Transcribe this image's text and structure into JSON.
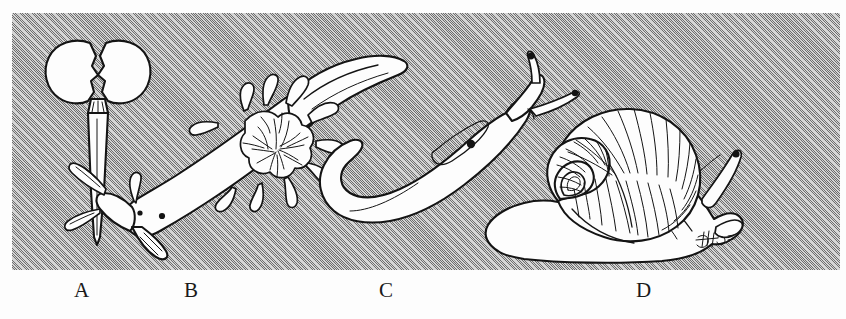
{
  "figure": {
    "caption_labels": [
      {
        "key": "a",
        "text": "A",
        "subject": "sea-butterfly-pteropod",
        "x": 74
      },
      {
        "key": "b",
        "text": "B",
        "subject": "nudibranch-sea-slug",
        "x": 184
      },
      {
        "key": "c",
        "text": "C",
        "subject": "terrestrial-slug",
        "x": 379
      },
      {
        "key": "d",
        "text": "D",
        "subject": "land-snail",
        "x": 636
      }
    ],
    "panel": {
      "x": 12,
      "y": 13,
      "width": 828,
      "height": 257,
      "background_color": "#a9a9a9",
      "texture": "diagonal-hatch-45deg",
      "ink_color": "#1a1a1a",
      "body_fill": "#fdfdfd"
    },
    "specimens": [
      {
        "id": "a",
        "name": "sea-butterfly",
        "description": "winged pteropod with two lateral parapodial lobes and a long tapering body",
        "orientation": "vertical"
      },
      {
        "id": "b",
        "name": "nudibranch",
        "description": "dorid sea slug with branched gill rosette, rhinophores, marginal papillae and a raised pointed tail",
        "orientation": "diagonal"
      },
      {
        "id": "c",
        "name": "slug",
        "description": "shell-less terrestrial slug, hook-shaped body with mantle shield and two tentacles",
        "orientation": "j-curve"
      },
      {
        "id": "d",
        "name": "snail",
        "description": "land snail with coiled striated spiral shell, broad foot, long upper eye tentacles and short lower tentacles",
        "orientation": "horizontal"
      }
    ],
    "signature": {
      "present": true,
      "label": "artist-monogram",
      "x": 700,
      "y": 225
    }
  }
}
